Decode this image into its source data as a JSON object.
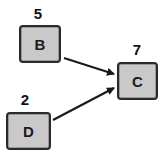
{
  "diagram": {
    "type": "directed-graph",
    "nodes": [
      {
        "id": "B",
        "label": "B",
        "value": "5"
      },
      {
        "id": "C",
        "label": "C",
        "value": "7"
      },
      {
        "id": "D",
        "label": "D",
        "value": "2"
      }
    ],
    "edges": [
      {
        "from": "B",
        "to": "C"
      },
      {
        "from": "D",
        "to": "C"
      }
    ],
    "colors": {
      "node_fill": "#c9c9c9",
      "node_border": "#2a2a2a",
      "edge": "#1a1a1a"
    }
  }
}
